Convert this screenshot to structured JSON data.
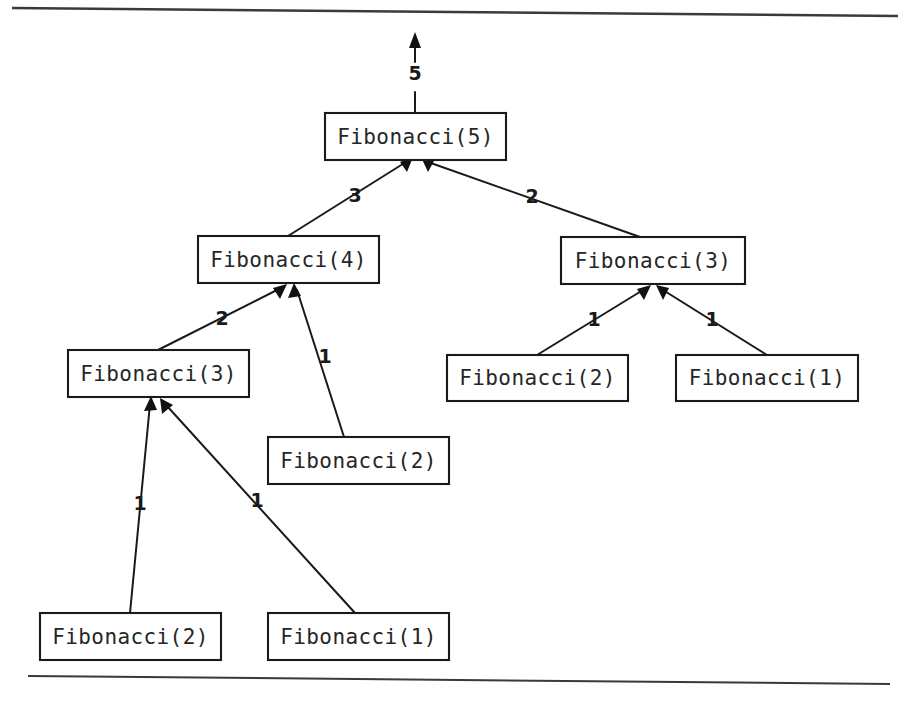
{
  "figure": {
    "type": "recursion-call-tree",
    "background_color": "#ffffff",
    "ink_color": "#1a1a1a",
    "result_label": "5",
    "nodes": [
      {
        "id": "fib5",
        "label": "Fibonacci(5)",
        "x": 325,
        "y": 113,
        "w": 181,
        "h": 47
      },
      {
        "id": "fib4",
        "label": "Fibonacci(4)",
        "x": 198,
        "y": 236,
        "w": 181,
        "h": 47
      },
      {
        "id": "fib3right",
        "label": "Fibonacci(3)",
        "x": 561,
        "y": 237,
        "w": 184,
        "h": 47
      },
      {
        "id": "fib3left",
        "label": "Fibonacci(3)",
        "x": 68,
        "y": 350,
        "w": 181,
        "h": 47
      },
      {
        "id": "fib2r",
        "label": "Fibonacci(2)",
        "x": 447,
        "y": 355,
        "w": 181,
        "h": 46
      },
      {
        "id": "fib1r",
        "label": "Fibonacci(1)",
        "x": 676,
        "y": 355,
        "w": 182,
        "h": 46
      },
      {
        "id": "fib2mid",
        "label": "Fibonacci(2)",
        "x": 268,
        "y": 437,
        "w": 181,
        "h": 47
      },
      {
        "id": "fib2bot",
        "label": "Fibonacci(2)",
        "x": 40,
        "y": 613,
        "w": 181,
        "h": 47
      },
      {
        "id": "fib1bot",
        "label": "Fibonacci(1)",
        "x": 268,
        "y": 613,
        "w": 181,
        "h": 47
      }
    ],
    "edges": [
      {
        "from": "fib4",
        "to": "fib5",
        "label": "3",
        "label_x": 355,
        "label_y": 196
      },
      {
        "from": "fib3right",
        "to": "fib5",
        "label": "2",
        "label_x": 532,
        "label_y": 197
      },
      {
        "from": "fib3left",
        "to": "fib4",
        "label": "2",
        "label_x": 222,
        "label_y": 319
      },
      {
        "from": "fib2mid",
        "to": "fib4",
        "label": "1",
        "label_x": 325,
        "label_y": 357
      },
      {
        "from": "fib2r",
        "to": "fib3right",
        "label": "1",
        "label_x": 594,
        "label_y": 320
      },
      {
        "from": "fib1r",
        "to": "fib3right",
        "label": "1",
        "label_x": 712,
        "label_y": 320
      },
      {
        "from": "fib2bot",
        "to": "fib3left",
        "label": "1",
        "label_x": 140,
        "label_y": 504
      },
      {
        "from": "fib1bot",
        "to": "fib3left",
        "label": "1",
        "label_x": 257,
        "label_y": 501
      }
    ],
    "rules": [
      {
        "id": "top-rule",
        "x1": 12,
        "y1": 8,
        "x2": 898,
        "y2": 16
      },
      {
        "id": "bottom-rule",
        "x1": 28,
        "y1": 676,
        "x2": 890,
        "y2": 684
      }
    ]
  }
}
